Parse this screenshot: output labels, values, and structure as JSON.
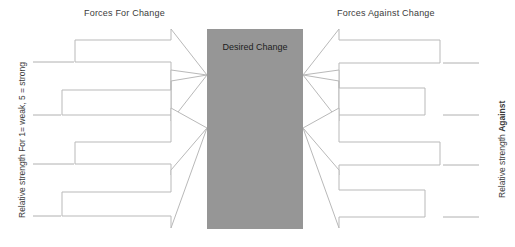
{
  "diagram": {
    "title_for": "Forces For Change",
    "title_against": "Forces Against Change",
    "center_label": "Desired Change",
    "left_axis_label": "Relative strength For 1= weak, 5 = strong",
    "right_axis_label_normal": "Relative strength ",
    "right_axis_label_bold": "Against",
    "colors": {
      "center_box_fill": "#969696",
      "arrow_stroke": "#b5b5b5",
      "arrow_fill": "#ffffff",
      "tick_line": "#b0b0b0",
      "text": "#3b3b3b"
    },
    "center_box": {
      "x": 207,
      "y": 29,
      "width": 96,
      "height": 200
    },
    "forces_for": [
      {
        "index": 1,
        "label": "",
        "body_top": 40,
        "body_bottom": 62,
        "tail_x": 75,
        "tick_y": 62,
        "tick_x1": 33,
        "tick_x2": 74
      },
      {
        "index": 2,
        "label": "",
        "body_top": 90,
        "body_bottom": 115,
        "tail_x": 62,
        "tick_y": 115,
        "tick_x1": 33,
        "tick_x2": 61
      },
      {
        "index": 3,
        "label": "",
        "body_top": 142,
        "body_bottom": 164,
        "tail_x": 75,
        "tick_y": 164,
        "tick_x1": 33,
        "tick_x2": 74
      },
      {
        "index": 4,
        "label": "",
        "body_top": 192,
        "body_bottom": 216,
        "tail_x": 62,
        "tick_y": 216,
        "tick_x1": 33,
        "tick_x2": 61
      }
    ],
    "forces_against": [
      {
        "index": 1,
        "label": "",
        "body_top": 40,
        "body_bottom": 63,
        "tail_x": 440,
        "tick_y": 63,
        "tick_x1": 443,
        "tick_x2": 479
      },
      {
        "index": 2,
        "label": "",
        "body_top": 88,
        "body_bottom": 115,
        "tail_x": 425,
        "tick_y": 115,
        "tick_x1": 443,
        "tick_x2": 479
      },
      {
        "index": 3,
        "label": "",
        "body_top": 142,
        "body_bottom": 165,
        "tail_x": 440,
        "tick_y": 165,
        "tick_x1": 443,
        "tick_x2": 479
      },
      {
        "index": 4,
        "label": "",
        "body_top": 190,
        "body_bottom": 217,
        "tail_x": 425,
        "tick_y": 217,
        "tick_x1": 443,
        "tick_x2": 479
      }
    ],
    "arrowhead_tips_left": [
      {
        "tip_y": 75
      },
      {
        "tip_y": 128
      }
    ],
    "arrowhead_tips_right": [
      {
        "tip_y": 75
      },
      {
        "tip_y": 128
      }
    ]
  }
}
